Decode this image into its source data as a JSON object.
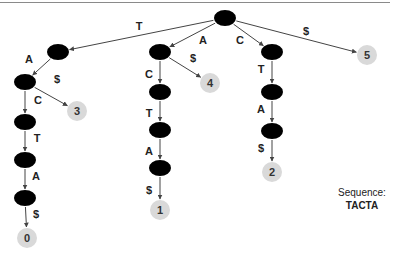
{
  "diagram": {
    "type": "suffix-tree",
    "colors": {
      "internal_node": "#000000",
      "leaf_node": "#d9d9d9",
      "edge": "#444444"
    },
    "nodes": [
      {
        "id": "root",
        "kind": "internal",
        "x": 225,
        "y": 18
      },
      {
        "id": "t",
        "kind": "internal",
        "x": 58,
        "y": 52
      },
      {
        "id": "ta",
        "kind": "internal",
        "x": 25,
        "y": 82
      },
      {
        "id": "tac",
        "kind": "internal",
        "x": 25,
        "y": 122
      },
      {
        "id": "tact",
        "kind": "internal",
        "x": 25,
        "y": 160
      },
      {
        "id": "tacta",
        "kind": "internal",
        "x": 25,
        "y": 198
      },
      {
        "id": "leaf0",
        "kind": "leaf",
        "label": "0",
        "x": 27,
        "y": 238
      },
      {
        "id": "leaf3",
        "kind": "leaf",
        "label": "3",
        "x": 77,
        "y": 111
      },
      {
        "id": "a",
        "kind": "internal",
        "x": 160,
        "y": 52
      },
      {
        "id": "ac",
        "kind": "internal",
        "x": 160,
        "y": 92
      },
      {
        "id": "act",
        "kind": "internal",
        "x": 160,
        "y": 130
      },
      {
        "id": "acta",
        "kind": "internal",
        "x": 160,
        "y": 168
      },
      {
        "id": "leaf1",
        "kind": "leaf",
        "label": "1",
        "x": 160,
        "y": 210
      },
      {
        "id": "leaf4",
        "kind": "leaf",
        "label": "4",
        "x": 210,
        "y": 83
      },
      {
        "id": "c",
        "kind": "internal",
        "x": 272,
        "y": 52
      },
      {
        "id": "ct",
        "kind": "internal",
        "x": 272,
        "y": 92
      },
      {
        "id": "cta",
        "kind": "internal",
        "x": 272,
        "y": 131
      },
      {
        "id": "leaf2",
        "kind": "leaf",
        "label": "2",
        "x": 272,
        "y": 172
      },
      {
        "id": "leaf5",
        "kind": "leaf",
        "label": "5",
        "x": 367,
        "y": 55
      }
    ],
    "edges": [
      {
        "from": "root",
        "to": "t",
        "label": "T"
      },
      {
        "from": "t",
        "to": "ta",
        "label": "A"
      },
      {
        "from": "ta",
        "to": "tac",
        "label": "C"
      },
      {
        "from": "ta",
        "to": "leaf3",
        "label": "$"
      },
      {
        "from": "tac",
        "to": "tact",
        "label": "T"
      },
      {
        "from": "tact",
        "to": "tacta",
        "label": "A"
      },
      {
        "from": "tacta",
        "to": "leaf0",
        "label": "$"
      },
      {
        "from": "root",
        "to": "a",
        "label": "A"
      },
      {
        "from": "a",
        "to": "ac",
        "label": "C"
      },
      {
        "from": "a",
        "to": "leaf4",
        "label": "$"
      },
      {
        "from": "ac",
        "to": "act",
        "label": "T"
      },
      {
        "from": "act",
        "to": "acta",
        "label": "A"
      },
      {
        "from": "acta",
        "to": "leaf1",
        "label": "$"
      },
      {
        "from": "root",
        "to": "c",
        "label": "C"
      },
      {
        "from": "c",
        "to": "ct",
        "label": "T"
      },
      {
        "from": "ct",
        "to": "cta",
        "label": "A"
      },
      {
        "from": "cta",
        "to": "leaf2",
        "label": "$"
      },
      {
        "from": "root",
        "to": "leaf5",
        "label": "$"
      }
    ],
    "edge_labels": [
      {
        "text": "T",
        "x": 139,
        "y": 30
      },
      {
        "text": "A",
        "x": 29,
        "y": 63
      },
      {
        "text": "$",
        "x": 57,
        "y": 83
      },
      {
        "text": "C",
        "x": 38,
        "y": 104
      },
      {
        "text": "T",
        "x": 37,
        "y": 142
      },
      {
        "text": "A",
        "x": 36,
        "y": 180
      },
      {
        "text": "$",
        "x": 36,
        "y": 218
      },
      {
        "text": "A",
        "x": 203,
        "y": 44
      },
      {
        "text": "$",
        "x": 193,
        "y": 62
      },
      {
        "text": "C",
        "x": 149,
        "y": 78
      },
      {
        "text": "T",
        "x": 149,
        "y": 117
      },
      {
        "text": "A",
        "x": 149,
        "y": 155
      },
      {
        "text": "$",
        "x": 149,
        "y": 194
      },
      {
        "text": "C",
        "x": 240,
        "y": 44
      },
      {
        "text": "T",
        "x": 261,
        "y": 73
      },
      {
        "text": "A",
        "x": 261,
        "y": 113
      },
      {
        "text": "$",
        "x": 261,
        "y": 152
      },
      {
        "text": "$",
        "x": 306,
        "y": 35
      }
    ]
  },
  "sequence": {
    "label": "Sequence:",
    "value": "TACTA"
  }
}
